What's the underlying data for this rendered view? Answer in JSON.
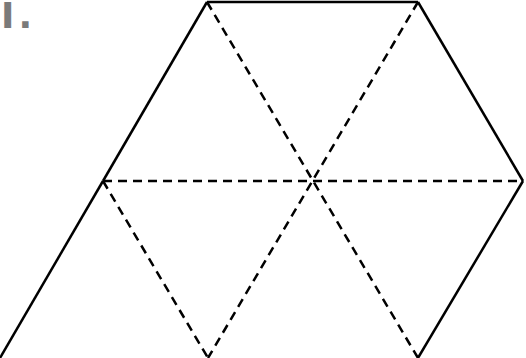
{
  "label": "I.",
  "colors": {
    "label": "#7a7a7a",
    "stroke": "#000000",
    "background": "#ffffff"
  },
  "diagram": {
    "vertices": {
      "top_left": [
        207,
        2
      ],
      "top_right": [
        418,
        2
      ],
      "right": [
        523,
        181
      ],
      "bottom_right": [
        418,
        357
      ],
      "bottom_left": [
        208,
        357
      ],
      "left": [
        103,
        181
      ],
      "center": [
        313,
        181
      ],
      "outer_bottom_left": [
        0,
        358
      ]
    },
    "solid_edges": [
      [
        "top_left",
        "top_right"
      ],
      [
        "top_right",
        "right"
      ],
      [
        "right",
        "bottom_right"
      ],
      [
        "top_left",
        "left"
      ],
      [
        "left",
        "outer_bottom_left"
      ]
    ],
    "dashed_edges": [
      [
        "left",
        "right"
      ],
      [
        "top_left",
        "bottom_right"
      ],
      [
        "top_right",
        "bottom_left"
      ],
      [
        "left",
        "bottom_left"
      ],
      [
        "top_left",
        "left"
      ]
    ]
  }
}
